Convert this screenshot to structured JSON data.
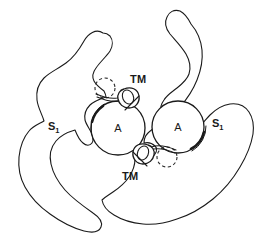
{
  "figure": {
    "type": "line-drawing-diagram",
    "background_color": "#ffffff",
    "stroke_color": "#1a1a1a",
    "width": 273,
    "height": 248,
    "labels": {
      "cell_left": "A",
      "cell_right": "A",
      "region_left_main": "S",
      "region_left_sub": "1",
      "region_right_main": "S",
      "region_right_sub": "1",
      "tm_top": "TM",
      "tm_bottom": "TM"
    },
    "elements": [
      {
        "name": "left-crescent-outline",
        "label": "S1",
        "role": "outer boundary, left"
      },
      {
        "name": "right-crescent-outline",
        "label": "S1",
        "role": "outer boundary, right"
      },
      {
        "name": "left-circle",
        "label": "A",
        "center": [
          118,
          128
        ],
        "radius": 27
      },
      {
        "name": "right-circle",
        "label": "A",
        "center": [
          178,
          127
        ],
        "radius": 26
      },
      {
        "name": "tm-top-structure",
        "label": "TM",
        "position": [
          128,
          96
        ]
      },
      {
        "name": "tm-bottom-structure",
        "label": "TM",
        "position": [
          148,
          156
        ]
      },
      {
        "name": "dashed-circle-top",
        "center": [
          105,
          88
        ],
        "radius": 10
      },
      {
        "name": "dashed-circle-bottom",
        "center": [
          167,
          157
        ],
        "radius": 10
      }
    ]
  }
}
